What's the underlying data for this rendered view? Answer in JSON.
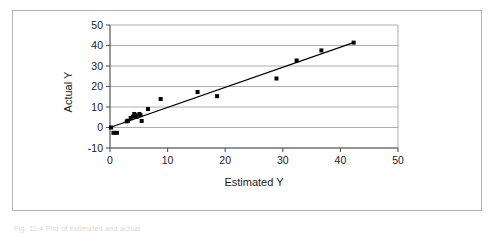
{
  "figure": {
    "border_color": "#b3b3b3",
    "background": "#ffffff",
    "caption_text": "Fig. 11.4  Plot of estimated and actual"
  },
  "chart_data": {
    "type": "scatter",
    "title": "",
    "xlabel": "Estimated Y",
    "ylabel": "Actual Y",
    "xlim": [
      0,
      50
    ],
    "ylim": [
      -10,
      50
    ],
    "xticks": [
      0,
      10,
      20,
      30,
      40,
      50
    ],
    "yticks": [
      -10,
      0,
      10,
      20,
      30,
      40,
      50
    ],
    "xtick_labels": [
      "0",
      "10",
      "20",
      "30",
      "40",
      "50"
    ],
    "ytick_labels": [
      "-10",
      "0",
      "10",
      "20",
      "30",
      "40",
      "50"
    ],
    "grid": "horizontal",
    "grid_color": "#999999",
    "legend": "none",
    "marker": {
      "shape": "square",
      "color": "#000000",
      "size": 4
    },
    "series": [
      {
        "name": "Observations",
        "type": "scatter",
        "points": [
          [
            0.2,
            0.0
          ],
          [
            0.6,
            -2.6
          ],
          [
            1.2,
            -2.6
          ],
          [
            2.9,
            3.0
          ],
          [
            3.1,
            3.3
          ],
          [
            3.6,
            4.6
          ],
          [
            4.0,
            5.3
          ],
          [
            4.2,
            6.6
          ],
          [
            4.4,
            6.0
          ],
          [
            4.6,
            5.2
          ],
          [
            5.1,
            6.6
          ],
          [
            5.3,
            6.0
          ],
          [
            5.5,
            3.2
          ],
          [
            6.6,
            9.0
          ],
          [
            8.8,
            13.9
          ],
          [
            15.2,
            17.3
          ],
          [
            18.6,
            15.3
          ],
          [
            28.9,
            23.9
          ],
          [
            32.4,
            32.7
          ],
          [
            36.7,
            37.6
          ],
          [
            42.3,
            41.4
          ]
        ]
      },
      {
        "name": "Fitted line",
        "type": "line",
        "color": "#000000",
        "endpoints": [
          [
            0.0,
            0.0
          ],
          [
            42.4,
            41.5
          ]
        ]
      }
    ]
  }
}
